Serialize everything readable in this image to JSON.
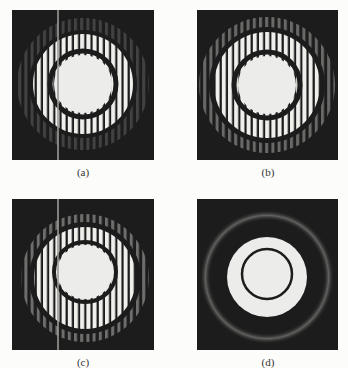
{
  "figure": {
    "panels": [
      {
        "id": "a",
        "label": "(a)",
        "description": "Ring diffraction pattern with vertical fringes and vertical bright line artifact"
      },
      {
        "id": "b",
        "label": "(b)",
        "description": "Ring diffraction pattern with vertical fringes, outer ring fringes visible"
      },
      {
        "id": "c",
        "label": "(c)",
        "description": "Ring diffraction pattern with vertical fringes, distorted inner disk and vertical line artifact"
      },
      {
        "id": "d",
        "label": "(d)",
        "description": "Ring diffraction pattern without fringes: bright disk with dark inner ring and faint outer halo"
      }
    ]
  },
  "colors": {
    "background": "#fcfcfb",
    "panel": "#1c1c1c",
    "bright": "#ececea"
  }
}
